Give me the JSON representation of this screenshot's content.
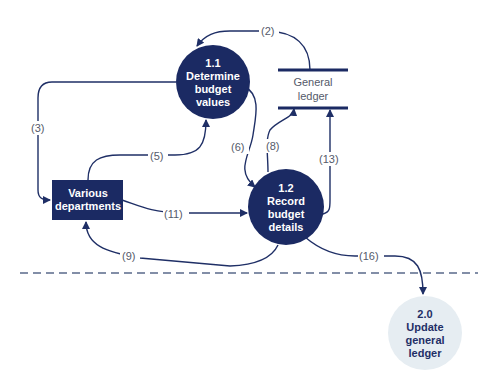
{
  "diagram": {
    "type": "data-flow-diagram",
    "colors": {
      "primary": "#1b2a63",
      "light_process": "#e6edf2",
      "line": "#1f2f66",
      "label": "#555a6a"
    },
    "processes": [
      {
        "id": "1.1",
        "lines": [
          "1.1",
          "Determine",
          "budget",
          "values"
        ]
      },
      {
        "id": "1.2",
        "lines": [
          "1.2",
          "Record",
          "budget",
          "details"
        ]
      },
      {
        "id": "2.0",
        "lines": [
          "2.0",
          "Update",
          "general",
          "ledger"
        ]
      }
    ],
    "entities": [
      {
        "id": "various-departments",
        "lines": [
          "Various",
          "departments"
        ]
      }
    ],
    "data_stores": [
      {
        "id": "general-ledger",
        "lines": [
          "General",
          "ledger"
        ]
      }
    ],
    "flows": [
      {
        "label": "(2)",
        "from": "General ledger",
        "to": "1.1"
      },
      {
        "label": "(3)",
        "from": "1.1",
        "to": "Various departments"
      },
      {
        "label": "(5)",
        "from": "Various departments",
        "to": "1.1"
      },
      {
        "label": "(6)",
        "from": "1.1",
        "to": "1.2"
      },
      {
        "label": "(8)",
        "from": "1.2",
        "to": "General ledger"
      },
      {
        "label": "(13)",
        "from": "1.2",
        "to": "General ledger"
      },
      {
        "label": "(11)",
        "from": "Various departments",
        "to": "1.2"
      },
      {
        "label": "(9)",
        "from": "1.2",
        "to": "Various departments"
      },
      {
        "label": "(16)",
        "from": "1.2",
        "to": "2.0"
      }
    ]
  }
}
